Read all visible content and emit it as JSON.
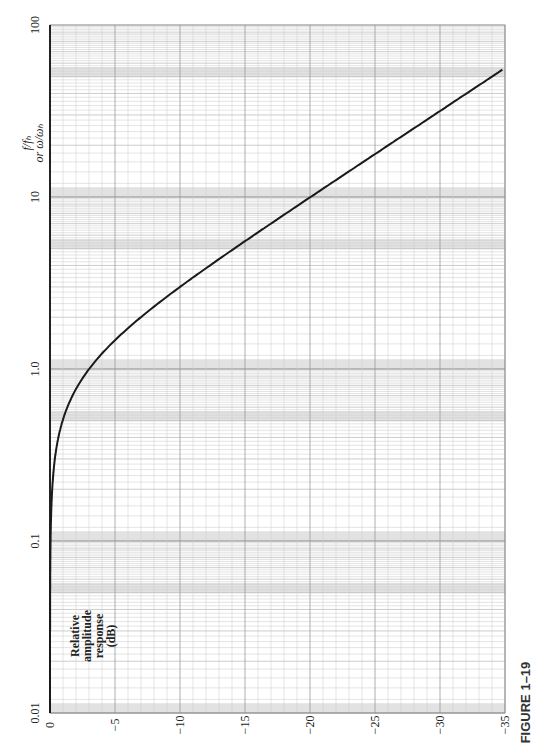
{
  "figure": {
    "caption": "FIGURE 1–19",
    "orientation": "rotated 90 degrees counter-clockwise"
  },
  "chart_data": {
    "type": "line",
    "title": "",
    "xlabel": "Relative amplitude response (dB)",
    "xlabel_lines": [
      "Relative",
      "amplitude",
      "response",
      "(dB)"
    ],
    "ylabel": "f/fb or ω/ωb",
    "ylabel_lines": [
      "f/fₕ",
      "or ω/ωₕ"
    ],
    "yscale": "log",
    "ylim": [
      0.01,
      100
    ],
    "xlim": [
      0,
      -35
    ],
    "grid": true,
    "x_ticks": [
      "0",
      "−5",
      "−10",
      "−15",
      "−20",
      "−25",
      "−30",
      "−35"
    ],
    "x_tick_values": [
      0,
      -5,
      -10,
      -15,
      -20,
      -25,
      -30,
      -35
    ],
    "y_ticks": [
      "0.01",
      "0.1",
      "1.0",
      "10",
      "100"
    ],
    "y_tick_values": [
      0.01,
      0.1,
      1.0,
      10,
      100
    ],
    "series": [
      {
        "name": "First-order low-pass response",
        "f_ratio": [
          0.01,
          0.05,
          0.1,
          0.2,
          0.3,
          0.5,
          0.7,
          1.0,
          1.5,
          2.0,
          3.0,
          5.0,
          7.0,
          10,
          20,
          30,
          56
        ],
        "db": [
          0.0,
          -0.01,
          -0.04,
          -0.17,
          -0.37,
          -0.97,
          -1.7,
          -3.0,
          -5.1,
          -7.0,
          -10.0,
          -14.2,
          -17.0,
          -20.0,
          -26.0,
          -29.5,
          -35.0
        ]
      }
    ]
  },
  "colors": {
    "curve": "#1a1a1a",
    "grid_minor": "#c8c8c8",
    "grid_major": "#9a9a9a",
    "band": "#e2e2e2"
  }
}
